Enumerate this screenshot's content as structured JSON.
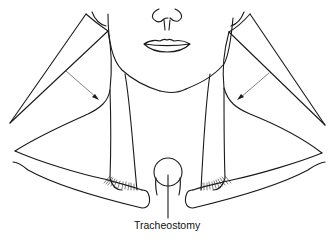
{
  "figure": {
    "type": "anatomical line drawing",
    "labels": [
      {
        "id": "tracheostomy",
        "text": "Tracheostomy"
      }
    ],
    "elements": {
      "face": [
        "nose",
        "lips",
        "chin"
      ],
      "neck": [
        "left sternocleidomastoid",
        "right sternocleidomastoid"
      ],
      "flaps": [
        "left triangular flap with rotation arrow",
        "right triangular flap with rotation arrow"
      ],
      "clavicles": [
        "left clavicle",
        "right clavicle"
      ],
      "stoma": "tracheostomy circle with leader line"
    },
    "colors": {
      "line": "#1a1a1a",
      "background": "#ffffff"
    }
  }
}
